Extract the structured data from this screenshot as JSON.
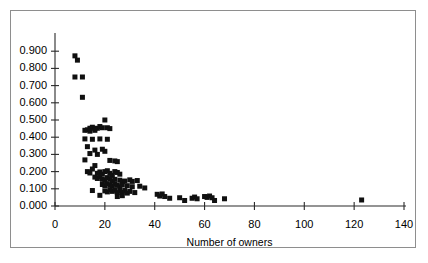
{
  "chart_data": {
    "type": "scatter",
    "title": "",
    "xlabel": "Number of owners",
    "ylabel": "",
    "xlim": [
      0,
      140
    ],
    "ylim": [
      0.0,
      0.9
    ],
    "grid": false,
    "legend": null,
    "xticks": [
      0,
      20,
      40,
      60,
      80,
      100,
      120,
      140
    ],
    "xtick_labels": [
      "0",
      "20",
      "40",
      "60",
      "80",
      "100",
      "120",
      "140"
    ],
    "yticks": [
      0.0,
      0.1,
      0.2,
      0.3,
      0.4,
      0.5,
      0.6,
      0.7,
      0.8,
      0.9
    ],
    "ytick_labels": [
      "0.000",
      "0.100",
      "0.200",
      "0.300",
      "0.400",
      "0.500",
      "0.600",
      "0.700",
      "0.800",
      "0.900"
    ],
    "marker": "square",
    "marker_color": "#101010",
    "marker_size": 5,
    "points": [
      [
        8,
        0.873
      ],
      [
        9,
        0.848
      ],
      [
        8,
        0.75
      ],
      [
        11,
        0.75
      ],
      [
        11,
        0.632
      ],
      [
        14,
        0.452
      ],
      [
        15,
        0.458
      ],
      [
        16,
        0.45
      ],
      [
        17,
        0.452
      ],
      [
        18,
        0.462
      ],
      [
        19,
        0.455
      ],
      [
        13,
        0.443
      ],
      [
        12,
        0.44
      ],
      [
        14,
        0.435
      ],
      [
        16,
        0.44
      ],
      [
        20,
        0.5
      ],
      [
        21,
        0.455
      ],
      [
        22,
        0.45
      ],
      [
        12,
        0.39
      ],
      [
        15,
        0.388
      ],
      [
        18,
        0.39
      ],
      [
        21,
        0.388
      ],
      [
        13,
        0.345
      ],
      [
        16,
        0.325
      ],
      [
        19,
        0.33
      ],
      [
        20,
        0.318
      ],
      [
        14,
        0.305
      ],
      [
        17,
        0.3
      ],
      [
        12,
        0.268
      ],
      [
        22,
        0.265
      ],
      [
        24,
        0.262
      ],
      [
        25,
        0.258
      ],
      [
        16,
        0.235
      ],
      [
        15,
        0.215
      ],
      [
        13,
        0.2
      ],
      [
        14,
        0.192
      ],
      [
        17,
        0.19
      ],
      [
        18,
        0.198
      ],
      [
        19,
        0.185
      ],
      [
        20,
        0.2
      ],
      [
        21,
        0.205
      ],
      [
        22,
        0.19
      ],
      [
        23,
        0.178
      ],
      [
        24,
        0.2
      ],
      [
        25,
        0.195
      ],
      [
        26,
        0.185
      ],
      [
        16,
        0.168
      ],
      [
        17,
        0.16
      ],
      [
        18,
        0.172
      ],
      [
        19,
        0.155
      ],
      [
        20,
        0.15
      ],
      [
        21,
        0.165
      ],
      [
        22,
        0.158
      ],
      [
        23,
        0.145
      ],
      [
        24,
        0.155
      ],
      [
        26,
        0.15
      ],
      [
        27,
        0.142
      ],
      [
        28,
        0.145
      ],
      [
        30,
        0.152
      ],
      [
        31,
        0.143
      ],
      [
        33,
        0.148
      ],
      [
        19,
        0.125
      ],
      [
        20,
        0.118
      ],
      [
        21,
        0.13
      ],
      [
        22,
        0.122
      ],
      [
        23,
        0.115
      ],
      [
        24,
        0.128
      ],
      [
        25,
        0.12
      ],
      [
        26,
        0.112
      ],
      [
        27,
        0.122
      ],
      [
        29,
        0.118
      ],
      [
        31,
        0.112
      ],
      [
        34,
        0.115
      ],
      [
        36,
        0.105
      ],
      [
        15,
        0.09
      ],
      [
        20,
        0.088
      ],
      [
        21,
        0.082
      ],
      [
        22,
        0.095
      ],
      [
        23,
        0.085
      ],
      [
        24,
        0.092
      ],
      [
        25,
        0.078
      ],
      [
        26,
        0.088
      ],
      [
        27,
        0.08
      ],
      [
        28,
        0.09
      ],
      [
        29,
        0.075
      ],
      [
        30,
        0.085
      ],
      [
        32,
        0.078
      ],
      [
        18,
        0.062
      ],
      [
        25,
        0.055
      ],
      [
        27,
        0.06
      ],
      [
        41,
        0.068
      ],
      [
        42,
        0.058
      ],
      [
        43,
        0.07
      ],
      [
        44,
        0.055
      ],
      [
        46,
        0.045
      ],
      [
        50,
        0.048
      ],
      [
        52,
        0.032
      ],
      [
        55,
        0.045
      ],
      [
        56,
        0.052
      ],
      [
        57,
        0.042
      ],
      [
        60,
        0.055
      ],
      [
        61,
        0.05
      ],
      [
        62,
        0.058
      ],
      [
        63,
        0.048
      ],
      [
        64,
        0.032
      ],
      [
        68,
        0.042
      ],
      [
        123,
        0.035
      ]
    ]
  },
  "axis": {
    "x_title": "Number of owners"
  }
}
